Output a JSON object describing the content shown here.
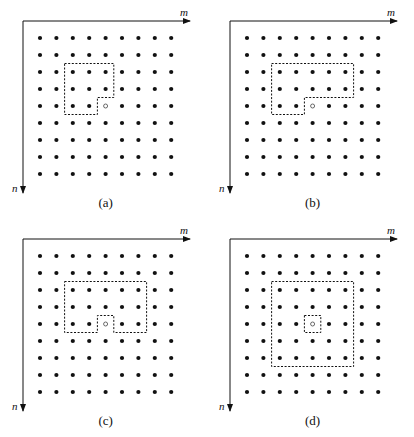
{
  "figure": {
    "grid": {
      "rows": 9,
      "cols": 9
    },
    "axes": {
      "horizontal_label": "m",
      "vertical_label": "n"
    },
    "colors": {
      "dot": "#111111",
      "axis": "#111111",
      "dashed_region": "#111111",
      "current_point": "#444444"
    },
    "panels": [
      {
        "id": "a",
        "caption": "(a)",
        "offset": [
          0,
          0
        ],
        "current": [
          4,
          4
        ],
        "region_polygon": [
          [
            1.5,
            1.5
          ],
          [
            4.5,
            1.5
          ],
          [
            4.5,
            3.5
          ],
          [
            3.5,
            3.5
          ],
          [
            3.5,
            4.5
          ],
          [
            1.5,
            4.5
          ]
        ],
        "inner_box": null
      },
      {
        "id": "b",
        "caption": "(b)",
        "offset": [
          207,
          0
        ],
        "current": [
          4,
          4
        ],
        "region_polygon": [
          [
            1.5,
            1.5
          ],
          [
            6.5,
            1.5
          ],
          [
            6.5,
            3.5
          ],
          [
            3.5,
            3.5
          ],
          [
            3.5,
            4.5
          ],
          [
            1.5,
            4.5
          ]
        ],
        "inner_box": null
      },
      {
        "id": "c",
        "caption": "(c)",
        "offset": [
          0,
          218
        ],
        "current": [
          4,
          4
        ],
        "region_polygon": [
          [
            1.5,
            1.5
          ],
          [
            6.5,
            1.5
          ],
          [
            6.5,
            4.5
          ],
          [
            4.5,
            4.5
          ],
          [
            4.5,
            3.5
          ],
          [
            3.5,
            3.5
          ],
          [
            3.5,
            4.5
          ],
          [
            1.5,
            4.5
          ]
        ],
        "inner_box": null
      },
      {
        "id": "d",
        "caption": "(d)",
        "offset": [
          207,
          218
        ],
        "current": [
          4,
          4
        ],
        "region_polygon": [
          [
            1.5,
            1.5
          ],
          [
            6.5,
            1.5
          ],
          [
            6.5,
            6.5
          ],
          [
            1.5,
            6.5
          ]
        ],
        "inner_box": [
          [
            3.5,
            3.5
          ],
          [
            4.5,
            3.5
          ],
          [
            4.5,
            4.5
          ],
          [
            3.5,
            4.5
          ]
        ]
      }
    ]
  }
}
